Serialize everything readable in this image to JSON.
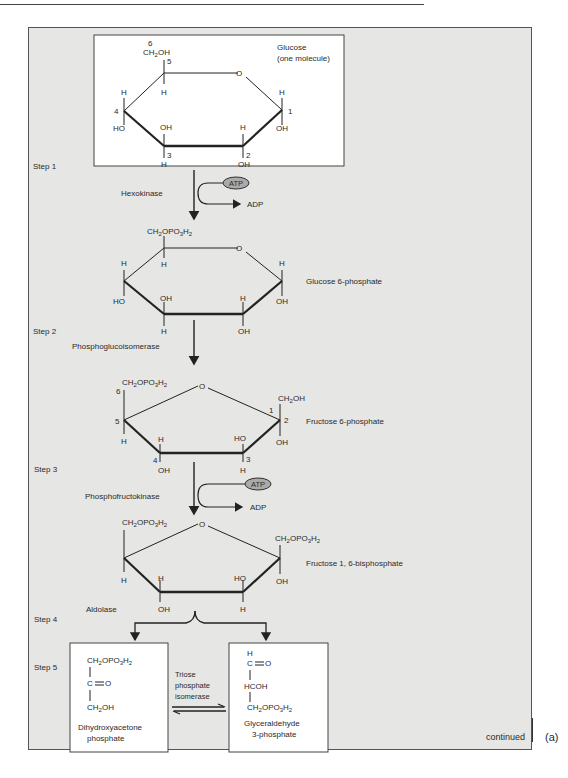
{
  "figure": {
    "panel_label": "(a)",
    "continued_label": "continued",
    "steps": [
      {
        "label": "Step 1",
        "enzyme": "Hexokinase",
        "cofactor_in": "ATP",
        "cofactor_out": "ADP"
      },
      {
        "label": "Step 2",
        "enzyme": "Phosphoglucoisomerase"
      },
      {
        "label": "Step 3",
        "enzyme": "Phosphofructokinase",
        "cofactor_in": "ATP",
        "cofactor_out": "ADP"
      },
      {
        "label": "Step 4",
        "enzyme": "Aldolase"
      },
      {
        "label": "Step 5",
        "enzyme_lines": [
          "Triose",
          "phosphate",
          "isomerase"
        ]
      }
    ],
    "molecules": {
      "glucose": {
        "name": "Glucose",
        "subtitle": "(one molecule)",
        "c6_group": "CH2OH",
        "carbon_numbers": [
          "1",
          "2",
          "3",
          "4",
          "5",
          "6"
        ]
      },
      "glucose6p": {
        "name": "Glucose 6-phosphate",
        "c6_group": "CH2OPO3H2"
      },
      "fructose6p": {
        "name": "Fructose 6-phosphate",
        "c6_group": "CH2OPO3H2",
        "c1_group": "CH2OH"
      },
      "fructose16bp": {
        "name": "Fructose 1, 6-bisphosphate",
        "c6_group": "CH2OPO3H2",
        "c1_group": "CH2OPO3H2"
      },
      "dhap": {
        "name_lines": [
          "Dihydroxyacetone",
          "phosphate"
        ],
        "formula": [
          "CH2OPO3H2",
          "C=O",
          "CH2OH"
        ]
      },
      "g3p": {
        "name_lines": [
          "Glyceraldehyde",
          "3-phosphate"
        ],
        "formula": [
          "H",
          "C=O",
          "HCOH",
          "CH2OPO3H2"
        ]
      }
    },
    "atoms": {
      "H": "H",
      "OH": "OH",
      "HO": "HO",
      "O": "O"
    }
  }
}
